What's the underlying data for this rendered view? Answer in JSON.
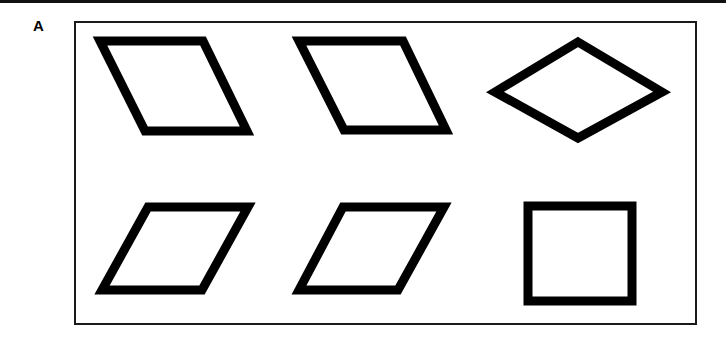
{
  "figure": {
    "panel_label": "A",
    "background_color": "#ffffff",
    "stroke_color": "#000000",
    "fill_color": "#ffffff",
    "frame_color": "#1a1a1a",
    "top_rule_color": "#111111"
  },
  "panel_frame": {
    "x": 74,
    "y": 21,
    "width": 623,
    "height": 304,
    "border_width": 2
  },
  "top_rule": {
    "x": 0,
    "y": 0,
    "width": 726,
    "height": 3
  },
  "shapes": [
    {
      "id": "shape-top-left",
      "name": "parallelogram-left-leaning-1",
      "kind": "parallelogram",
      "row": 1,
      "column": 1,
      "stroke_width": 9,
      "points": "100,41 203,41 247,131 145,131"
    },
    {
      "id": "shape-top-middle",
      "name": "parallelogram-left-leaning-2",
      "kind": "parallelogram",
      "row": 1,
      "column": 2,
      "stroke_width": 9,
      "points": "299,41 403,41 446,130 344,130"
    },
    {
      "id": "shape-top-right",
      "name": "diamond-rhombus",
      "kind": "rhombus",
      "row": 1,
      "column": 3,
      "stroke_width": 9,
      "points": "578,42 662,92 578,138 495,92"
    },
    {
      "id": "shape-bottom-left",
      "name": "parallelogram-right-leaning-1",
      "kind": "parallelogram",
      "row": 2,
      "column": 1,
      "stroke_width": 9,
      "points": "148,207 248,207 202,290 102,290"
    },
    {
      "id": "shape-bottom-middle",
      "name": "parallelogram-right-leaning-2",
      "kind": "parallelogram",
      "row": 2,
      "column": 2,
      "stroke_width": 9,
      "points": "343,207 444,207 398,290 299,290"
    },
    {
      "id": "shape-bottom-right",
      "name": "rectangle",
      "kind": "rectangle",
      "row": 2,
      "column": 3,
      "stroke_width": 9,
      "x": 528,
      "y": 206,
      "width": 104,
      "height": 95
    }
  ]
}
